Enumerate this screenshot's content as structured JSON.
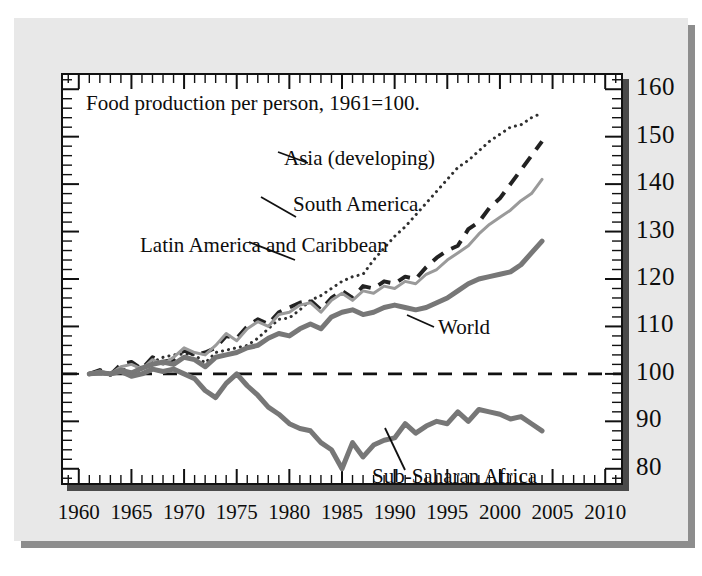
{
  "figure": {
    "title": "Food production per person, 1961=100.",
    "background": "#e8e8e8",
    "plot_background": "#ffffff",
    "frame_color": "#111111",
    "shadow_color": "#4a4a4a"
  },
  "annotations": {
    "asia": "Asia (developing)",
    "south_america": "South America",
    "latin_america": "Latin America and Caribbean",
    "world": "World",
    "africa": "Sub-Saharan Africa"
  },
  "chart_data": {
    "type": "line",
    "title": "Food production per person, 1961=100.",
    "xlabel": "",
    "ylabel": "",
    "xlim": [
      1958.5,
      2011.5
    ],
    "ylim": [
      77,
      163
    ],
    "grid": false,
    "legend": "inline-labels",
    "xticks": [
      "1960",
      "1965",
      "1970",
      "1975",
      "1980",
      "1985",
      "1990",
      "1995",
      "2000",
      "2005",
      "2010"
    ],
    "xtick_values": [
      1960,
      1965,
      1970,
      1975,
      1980,
      1985,
      1990,
      1995,
      2000,
      2005,
      2010
    ],
    "yticks": [
      "80",
      "90",
      "100",
      "110",
      "120",
      "130",
      "140",
      "150",
      "160"
    ],
    "ytick_values": [
      80,
      90,
      100,
      110,
      120,
      130,
      140,
      150,
      160
    ],
    "minor_tick_step_x": 1,
    "minor_tick_step_y": 2,
    "reference_line": {
      "value": 100,
      "style": "dashed",
      "color": "#111111"
    },
    "x": [
      1961,
      1962,
      1963,
      1964,
      1965,
      1966,
      1967,
      1968,
      1969,
      1970,
      1971,
      1972,
      1973,
      1974,
      1975,
      1976,
      1977,
      1978,
      1979,
      1980,
      1981,
      1982,
      1983,
      1984,
      1985,
      1986,
      1987,
      1988,
      1989,
      1990,
      1991,
      1992,
      1993,
      1994,
      1995,
      1996,
      1997,
      1998,
      1999,
      2000,
      2001,
      2002,
      2003,
      2004
    ],
    "series": [
      {
        "name": "Asia (developing)",
        "style": "dotted",
        "color": "#303030",
        "width": 3,
        "values": [
          100,
          100.5,
          100.2,
          101.2,
          100.3,
          101.5,
          102.5,
          103.5,
          104.0,
          104.2,
          104.0,
          102.3,
          104.5,
          105.0,
          105.5,
          106.0,
          107.5,
          109.5,
          111.5,
          111.8,
          113.5,
          115.5,
          116.5,
          118.0,
          119.5,
          120.5,
          121.0,
          124.0,
          126.5,
          129.0,
          131.0,
          133.5,
          136.0,
          138.5,
          141.0,
          143.5,
          145.0,
          147.0,
          149.0,
          150.5,
          152.0,
          152.5,
          154.0,
          155.0
        ]
      },
      {
        "name": "South America",
        "style": "dashed",
        "color": "#222222",
        "width": 4,
        "values": [
          100,
          100.8,
          99.8,
          102.0,
          102.5,
          101.0,
          103.5,
          102.5,
          103.0,
          105.0,
          104.0,
          104.5,
          105.5,
          108.0,
          107.5,
          110.0,
          111.5,
          110.5,
          113.0,
          114.0,
          115.0,
          115.5,
          113.5,
          116.0,
          117.5,
          116.0,
          118.5,
          118.0,
          119.5,
          119.0,
          120.5,
          120.0,
          122.5,
          124.5,
          126.0,
          127.0,
          130.5,
          132.0,
          135.0,
          137.0,
          140.0,
          143.0,
          146.0,
          149.0
        ]
      },
      {
        "name": "Latin America and Caribbean",
        "style": "solid",
        "color": "#9a9a9a",
        "width": 3,
        "values": [
          100,
          100.6,
          100.0,
          101.5,
          102.0,
          101.0,
          103.0,
          102.0,
          103.5,
          105.5,
          104.5,
          104.0,
          106.0,
          108.5,
          107.0,
          109.5,
          111.0,
          110.0,
          112.5,
          113.0,
          114.5,
          115.0,
          113.0,
          115.5,
          117.0,
          115.5,
          117.5,
          117.0,
          118.5,
          118.0,
          119.5,
          119.0,
          121.0,
          122.0,
          124.0,
          125.5,
          127.0,
          129.5,
          131.5,
          133.0,
          134.5,
          136.5,
          138.0,
          141.0
        ]
      },
      {
        "name": "World",
        "style": "solid",
        "color": "#777777",
        "width": 5,
        "values": [
          100,
          100.3,
          100.0,
          100.8,
          100.2,
          101.2,
          102.0,
          102.5,
          102.0,
          103.5,
          103.0,
          101.5,
          103.5,
          104.0,
          104.5,
          105.5,
          106.0,
          107.5,
          108.5,
          108.0,
          109.5,
          110.5,
          109.5,
          112.0,
          113.0,
          113.5,
          112.5,
          113.0,
          114.0,
          114.5,
          114.0,
          113.5,
          114.0,
          115.0,
          116.0,
          117.5,
          119.0,
          120.0,
          120.5,
          121.0,
          121.5,
          123.0,
          125.5,
          128.0
        ]
      },
      {
        "name": "Sub-Saharan Africa",
        "style": "solid",
        "color": "#777777",
        "width": 5,
        "values": [
          100,
          100.2,
          100.0,
          100.5,
          99.5,
          100.0,
          101.0,
          100.5,
          101.0,
          100.0,
          99.0,
          96.5,
          95.0,
          98.0,
          100.0,
          97.5,
          95.5,
          93.0,
          91.5,
          89.5,
          88.5,
          88.0,
          85.5,
          84.0,
          80.0,
          85.5,
          82.5,
          85.0,
          86.0,
          86.5,
          89.5,
          87.5,
          89.0,
          90.0,
          89.5,
          92.0,
          90.0,
          92.5,
          92.0,
          91.5,
          90.5,
          91.0,
          89.5,
          88.0
        ]
      }
    ]
  }
}
